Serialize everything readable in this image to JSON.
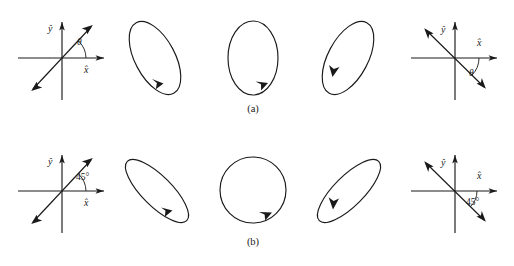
{
  "figure": {
    "background_color": "#ffffff",
    "ink_color": "#1a1a1a",
    "width": 514,
    "height": 266,
    "rows": [
      {
        "id": "row-a",
        "caption": "(a)",
        "caption_x": 253,
        "caption_y": 112,
        "angle_label": "θ",
        "angle_value_deg": 45,
        "axes_left": {
          "name": "axes-diagram-left-a",
          "cx": 62,
          "cy": 58,
          "x_axis_label": "x̂",
          "y_axis_label": "ŷ",
          "vector_label": "θ",
          "vector_direction_deg": 45,
          "vector_double_headed": true
        },
        "axes_right": {
          "name": "axes-diagram-right-a",
          "cx": 455,
          "cy": 58,
          "x_axis_label": "x̂",
          "y_axis_label": "ŷ",
          "vector_label": "θ",
          "vector_direction_deg": -38,
          "vector_double_headed": true
        },
        "ellipses": [
          {
            "name": "polarization-ellipse-a1",
            "cx": 155,
            "cy": 58,
            "rx": 20,
            "ry": 40,
            "tilt_deg": -28,
            "rotation_sense": "counterclockwise",
            "arrow_t_deg": 112
          },
          {
            "name": "polarization-ellipse-a2",
            "cx": 253,
            "cy": 58,
            "rx": 25,
            "ry": 37,
            "tilt_deg": 0,
            "rotation_sense": "counterclockwise",
            "arrow_t_deg": 112
          },
          {
            "name": "polarization-ellipse-a3",
            "cx": 348,
            "cy": 58,
            "rx": 20,
            "ry": 40,
            "tilt_deg": 28,
            "rotation_sense": "clockwise",
            "arrow_t_deg": 112
          }
        ]
      },
      {
        "id": "row-b",
        "caption": "(b)",
        "caption_x": 253,
        "caption_y": 245,
        "angle_label": "45°",
        "angle_value_deg": 45,
        "axes_left": {
          "name": "axes-diagram-left-b",
          "cx": 62,
          "cy": 191,
          "x_axis_label": "x̂",
          "y_axis_label": "ŷ",
          "vector_label": "45°",
          "vector_direction_deg": 45,
          "vector_double_headed": true
        },
        "axes_right": {
          "name": "axes-diagram-right-b",
          "cx": 455,
          "cy": 191,
          "x_axis_label": "x̂",
          "y_axis_label": "ŷ",
          "vector_label": "45°",
          "vector_direction_deg": -38,
          "vector_double_headed": true
        },
        "ellipses": [
          {
            "name": "polarization-ellipse-b1",
            "cx": 157,
            "cy": 191,
            "rx": 15,
            "ry": 42,
            "tilt_deg": -45,
            "rotation_sense": "counterclockwise",
            "arrow_t_deg": 112
          },
          {
            "name": "polarization-ellipse-b2",
            "cx": 253,
            "cy": 190,
            "rx": 33,
            "ry": 33,
            "tilt_deg": 0,
            "rotation_sense": "counterclockwise",
            "arrow_t_deg": 118
          },
          {
            "name": "polarization-ellipse-b3",
            "cx": 349,
            "cy": 191,
            "rx": 15,
            "ry": 42,
            "tilt_deg": 45,
            "rotation_sense": "clockwise",
            "arrow_t_deg": 112
          }
        ]
      }
    ]
  }
}
